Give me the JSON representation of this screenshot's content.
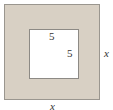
{
  "diagram": {
    "outer_square": {
      "side_label": "x",
      "fill": "#d8d0c4",
      "border": "#9a968f"
    },
    "inner_square": {
      "side_label_top": "5",
      "side_label_right": "5",
      "fill": "#ffffff",
      "border": "#8d8a85"
    },
    "labels": {
      "inner_top": "5",
      "inner_right": "5",
      "outer_right": "x",
      "outer_bottom": "x"
    }
  }
}
